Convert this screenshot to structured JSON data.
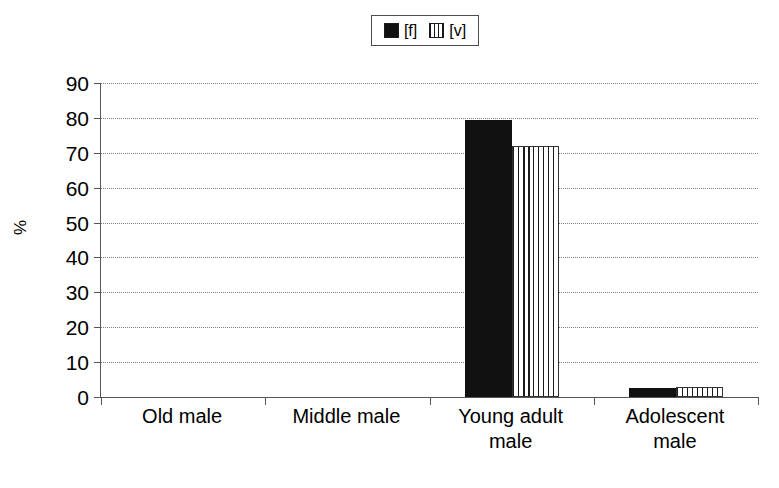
{
  "chart_data": {
    "type": "bar",
    "title": "",
    "subtitle": "",
    "xlabel": "",
    "ylabel": "%",
    "ylim": [
      0,
      90
    ],
    "ytick_step": 10,
    "yticks": [
      90,
      80,
      70,
      60,
      50,
      40,
      30,
      20,
      10,
      0
    ],
    "grid": true,
    "grid_style": "dotted-horizontal",
    "legend_position": "top-center",
    "categories": [
      "Old male",
      "Middle male",
      "Young adult male",
      "Adolescent male"
    ],
    "category_lines": [
      [
        "Old male"
      ],
      [
        "Middle male"
      ],
      [
        "Young adult",
        "male"
      ],
      [
        "Adolescent",
        "male"
      ]
    ],
    "series": [
      {
        "name": "[f]",
        "fill": "solid-black",
        "color": "#111111",
        "values": [
          0,
          0,
          79.5,
          2.5
        ]
      },
      {
        "name": "[v]",
        "fill": "vertical-stripes",
        "color": "#ffffff",
        "values": [
          0,
          0,
          72,
          3
        ]
      }
    ]
  },
  "legend": {
    "entries": [
      {
        "label": "[f]",
        "swatch": "solid-black-swatch"
      },
      {
        "label": "[v]",
        "swatch": "vertical-striped-swatch"
      }
    ]
  },
  "axes": {
    "y_title": "%",
    "y_tick_labels": [
      "90",
      "80",
      "70",
      "60",
      "50",
      "40",
      "30",
      "20",
      "10",
      "0"
    ],
    "x_tick_labels": [
      "Old male",
      "Middle male",
      "Young adult male",
      "Adolescent male"
    ]
  },
  "colors": {
    "axis": "#555555",
    "grid": "#808080",
    "series_f": "#111111",
    "series_v": "#ffffff",
    "background": "#ffffff"
  }
}
